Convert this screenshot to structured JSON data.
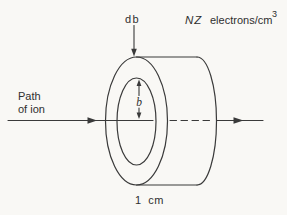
{
  "figure": {
    "colors": {
      "bg": "#f9f8f5",
      "ink": "#3a3a3a",
      "text": "#2f2f2f"
    },
    "labels": {
      "shell_thickness": "db",
      "density_symbol": "NZ",
      "density_unit": "electrons/cm",
      "density_exponent": "3",
      "path_line1": "Path",
      "path_line2": "of ion",
      "impact_parameter": "b",
      "slab_width": "1 cm"
    }
  }
}
